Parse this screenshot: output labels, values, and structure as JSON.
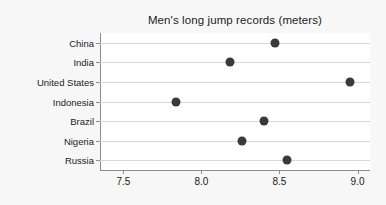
{
  "chart_data": {
    "type": "scatter",
    "title": "Men's long jump records (meters)",
    "xlabel": "",
    "ylabel": "",
    "categories": [
      "China",
      "India",
      "United States",
      "Indonesia",
      "Brazil",
      "Nigeria",
      "Russia"
    ],
    "values": [
      8.47,
      8.18,
      8.95,
      7.84,
      8.4,
      8.26,
      8.55
    ],
    "xlim": [
      7.35,
      9.08
    ],
    "ylim_categories": 7,
    "xticks": [
      7.5,
      8.0,
      8.5,
      9.0
    ],
    "xticklabels": [
      "7.5",
      "8.0",
      "8.5",
      "9.0"
    ],
    "grid": "horizontal",
    "legend": "none",
    "marker": "filled-circle",
    "marker_color": "#3a3a3a",
    "plot_background": "#ffffff",
    "figure_background": "#f7f7f7",
    "axis_color": "#8c8c8c",
    "gridline_color": "#d8d8d8"
  }
}
